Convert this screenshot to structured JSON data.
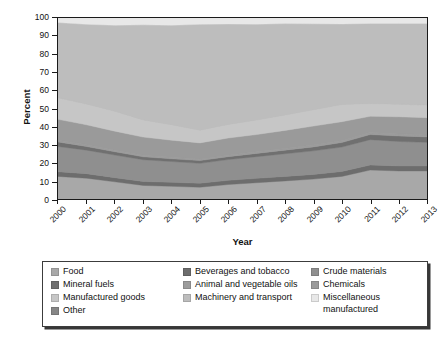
{
  "chart_data": {
    "type": "area",
    "title": "",
    "xlabel": "Year",
    "ylabel": "Percent",
    "stacked": true,
    "normalized_percent": true,
    "grid": false,
    "legend_position": "bottom",
    "ylim": [
      0,
      100
    ],
    "yticks": [
      0,
      10,
      20,
      30,
      40,
      50,
      60,
      70,
      80,
      90,
      100
    ],
    "categories": [
      "2000",
      "2001",
      "2002",
      "2003",
      "2004",
      "2005",
      "2006",
      "2007",
      "2008",
      "2009",
      "2010",
      "2011",
      "2012",
      "2013"
    ],
    "x": [
      2000,
      2001,
      2002,
      2003,
      2004,
      2005,
      2006,
      2007,
      2008,
      2009,
      2010,
      2011,
      2012,
      2013
    ],
    "series": [
      {
        "name": "Food",
        "color": "#a8a8a8",
        "values": [
          12.5,
          11.5,
          9.5,
          7.5,
          7.0,
          6.5,
          8.0,
          9.0,
          10.0,
          11.0,
          12.5,
          16.0,
          15.5,
          15.5
        ]
      },
      {
        "name": "Beverages and tobacco",
        "color": "#6d6d6d",
        "values": [
          2.5,
          2.5,
          2.3,
          2.2,
          2.2,
          2.2,
          2.3,
          2.4,
          2.5,
          2.6,
          2.7,
          2.8,
          2.8,
          2.8
        ]
      },
      {
        "name": "Crude materials",
        "color": "#8f8f8f",
        "values": [
          14.0,
          13.0,
          12.5,
          12.0,
          11.5,
          11.0,
          11.5,
          12.0,
          12.5,
          13.0,
          13.5,
          14.0,
          13.5,
          13.0
        ]
      },
      {
        "name": "Mineral fuels",
        "color": "#707070",
        "values": [
          2.5,
          2.0,
          1.8,
          1.6,
          1.5,
          1.5,
          1.6,
          1.8,
          2.0,
          2.2,
          2.5,
          2.8,
          3.0,
          3.0
        ]
      },
      {
        "name": "Animal and vegetable oils",
        "color": "#9c9c9c",
        "values": [
          1.0,
          1.0,
          0.9,
          0.9,
          0.8,
          0.8,
          0.8,
          0.9,
          0.9,
          1.0,
          1.0,
          1.1,
          1.1,
          1.1
        ]
      },
      {
        "name": "Chemicals",
        "color": "#9a9a9a",
        "values": [
          11.5,
          11.0,
          10.5,
          10.0,
          9.5,
          9.0,
          9.5,
          9.5,
          10.0,
          10.5,
          10.5,
          9.0,
          9.5,
          9.5
        ]
      },
      {
        "name": "Manufactured goods",
        "color": "#c6c6c6",
        "values": [
          12.0,
          11.5,
          11.0,
          9.5,
          8.5,
          7.0,
          7.5,
          8.0,
          8.5,
          9.0,
          9.5,
          7.0,
          7.0,
          7.0
        ]
      },
      {
        "name": "Machinery and transport",
        "color": "#bdbdbd",
        "values": [
          41.5,
          44.0,
          47.5,
          52.5,
          55.0,
          58.5,
          55.5,
          53.0,
          50.5,
          47.5,
          44.5,
          44.3,
          44.6,
          45.1
        ]
      },
      {
        "name": "Miscellaneous manufactured",
        "color": "#e8e8e8",
        "values": [
          2.5,
          3.5,
          4.0,
          3.8,
          4.0,
          3.5,
          3.3,
          3.4,
          3.1,
          3.2,
          3.3,
          3.0,
          3.0,
          3.0
        ]
      },
      {
        "name": "Other",
        "color": "#868686",
        "values": [
          0.0,
          0.0,
          0.0,
          0.0,
          0.0,
          0.0,
          0.0,
          0.0,
          0.0,
          0.0,
          0.0,
          0.0,
          0.0,
          0.0
        ]
      }
    ]
  },
  "legend": {
    "items": [
      {
        "label": "Food",
        "color": "#a8a8a8"
      },
      {
        "label": "Beverages and tobacco",
        "color": "#6d6d6d"
      },
      {
        "label": "Crude materials",
        "color": "#8f8f8f"
      },
      {
        "label": "Mineral fuels",
        "color": "#707070"
      },
      {
        "label": "Animal and vegetable oils",
        "color": "#9c9c9c"
      },
      {
        "label": "Chemicals",
        "color": "#9a9a9a"
      },
      {
        "label": "Manufactured goods",
        "color": "#c6c6c6"
      },
      {
        "label": "Machinery and transport",
        "color": "#bdbdbd"
      },
      {
        "label": "Miscellaneous\nmanufactured",
        "color": "#e8e8e8"
      },
      {
        "label": "Other",
        "color": "#868686"
      }
    ]
  }
}
